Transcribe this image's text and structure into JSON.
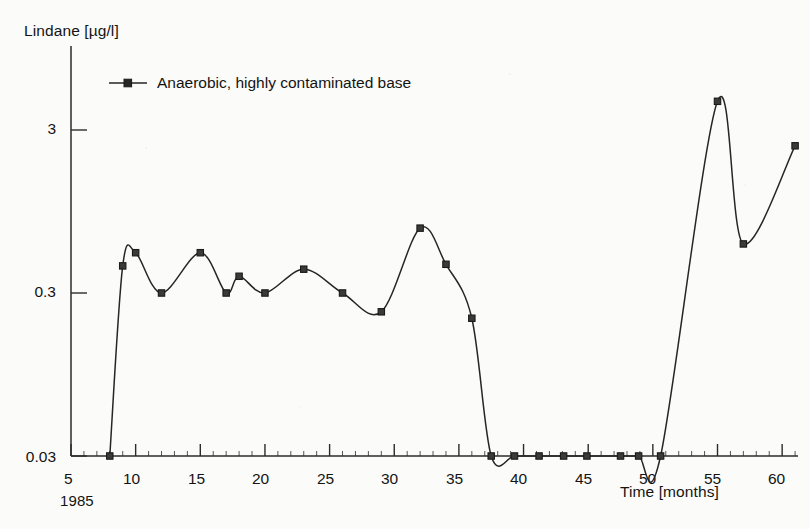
{
  "figure": {
    "background_color": "#fbfbf9",
    "ink_color": "#262626"
  },
  "legend": {
    "position": "top-left-inside",
    "entries": [
      {
        "label": "Anaerobic, highly contaminated base",
        "marker": "filled-square-marker",
        "color": "#262626"
      }
    ]
  },
  "axes": {
    "y": {
      "title": "Lindane [µg/l]",
      "scale": "log",
      "tick_labels": [
        "3",
        "0.3",
        "0.03"
      ],
      "tick_values": [
        3,
        0.3,
        0.03
      ],
      "limits": [
        0.03,
        7.5
      ]
    },
    "x": {
      "title": "Time [months]",
      "scale": "linear",
      "origin_note": "1985",
      "tick_labels": [
        "5",
        "10",
        "15",
        "20",
        "25",
        "30",
        "35",
        "40",
        "45",
        "50",
        "55",
        "60"
      ],
      "tick_values": [
        5,
        10,
        15,
        20,
        25,
        30,
        35,
        40,
        45,
        50,
        55,
        60
      ],
      "limits": [
        5,
        62
      ]
    }
  },
  "chart_data": {
    "type": "line",
    "title": "",
    "xlabel": "Time [months]",
    "ylabel": "Lindane [µg/l]",
    "xlim": [
      5,
      62
    ],
    "ylim": [
      0.03,
      7.5
    ],
    "yscale": "log",
    "xscale": "linear",
    "grid": false,
    "legend_position": "top-left-inside",
    "series": [
      {
        "name": "Anaerobic, highly contaminated base",
        "marker": "square",
        "color": "#262626",
        "x": [
          8,
          9,
          10,
          12,
          15,
          17,
          18,
          20,
          23,
          26,
          29,
          32,
          34,
          36,
          37.5,
          39.3,
          41.2,
          43.1,
          44.9,
          47.5,
          48.9,
          50.6,
          55,
          57,
          61
        ],
        "y": [
          0.03,
          0.44,
          0.53,
          0.3,
          0.53,
          0.3,
          0.38,
          0.3,
          0.42,
          0.3,
          0.23,
          0.75,
          0.45,
          0.21,
          0.03,
          0.03,
          0.03,
          0.03,
          0.03,
          0.03,
          0.03,
          0.03,
          4.5,
          0.6,
          2.4
        ]
      }
    ]
  }
}
